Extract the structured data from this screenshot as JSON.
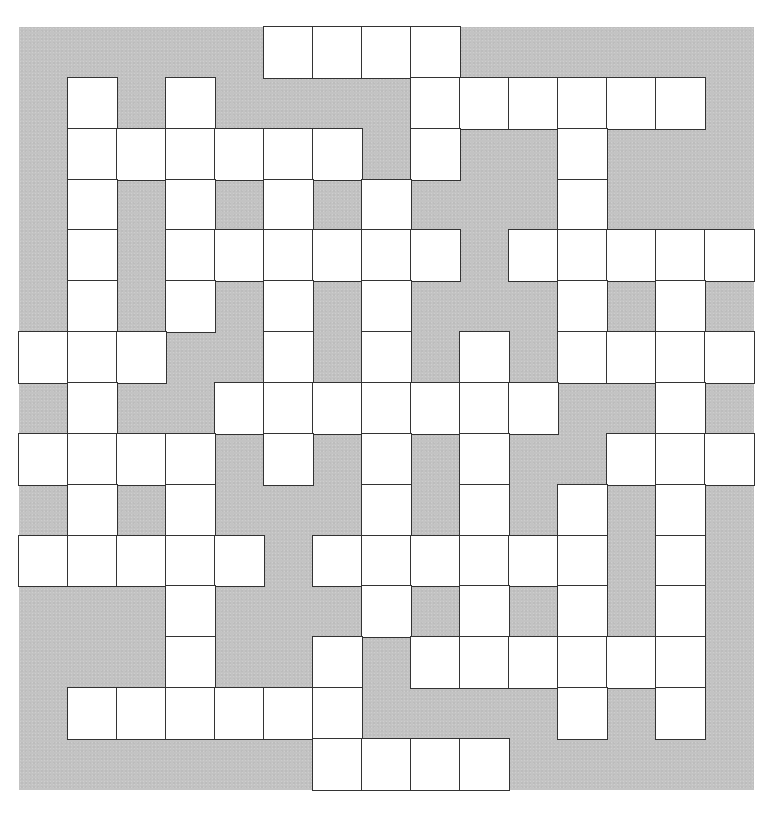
{
  "puzzle": {
    "type": "crossword",
    "rows": 15,
    "cols": 15,
    "colors": {
      "block": "#c3c3c3",
      "cell": "#ffffff",
      "border": "#333333",
      "page": "#ffffff"
    },
    "legend": {
      "1": "open-cell",
      "0": "block-cell"
    },
    "grid": [
      [
        0,
        0,
        0,
        0,
        0,
        1,
        1,
        1,
        1,
        0,
        0,
        0,
        0,
        0,
        0
      ],
      [
        0,
        1,
        0,
        1,
        0,
        0,
        0,
        0,
        1,
        1,
        1,
        1,
        1,
        1,
        0
      ],
      [
        0,
        1,
        1,
        1,
        1,
        1,
        1,
        0,
        1,
        0,
        0,
        1,
        0,
        0,
        0
      ],
      [
        0,
        1,
        0,
        1,
        0,
        1,
        0,
        1,
        0,
        0,
        0,
        1,
        0,
        0,
        0
      ],
      [
        0,
        1,
        0,
        1,
        1,
        1,
        1,
        1,
        1,
        0,
        1,
        1,
        1,
        1,
        1
      ],
      [
        0,
        1,
        0,
        1,
        0,
        1,
        0,
        1,
        0,
        0,
        0,
        1,
        0,
        1,
        0
      ],
      [
        1,
        1,
        1,
        0,
        0,
        1,
        0,
        1,
        0,
        1,
        0,
        1,
        1,
        1,
        1
      ],
      [
        0,
        1,
        0,
        0,
        1,
        1,
        1,
        1,
        1,
        1,
        1,
        0,
        0,
        1,
        0
      ],
      [
        1,
        1,
        1,
        1,
        0,
        1,
        0,
        1,
        0,
        1,
        0,
        0,
        1,
        1,
        1
      ],
      [
        0,
        1,
        0,
        1,
        0,
        0,
        0,
        1,
        0,
        1,
        0,
        1,
        0,
        1,
        0
      ],
      [
        1,
        1,
        1,
        1,
        1,
        0,
        1,
        1,
        1,
        1,
        1,
        1,
        0,
        1,
        0
      ],
      [
        0,
        0,
        0,
        1,
        0,
        0,
        0,
        1,
        0,
        1,
        0,
        1,
        0,
        1,
        0
      ],
      [
        0,
        0,
        0,
        1,
        0,
        0,
        1,
        0,
        1,
        1,
        1,
        1,
        1,
        1,
        0
      ],
      [
        0,
        1,
        1,
        1,
        1,
        1,
        1,
        0,
        0,
        0,
        0,
        1,
        0,
        1,
        0
      ],
      [
        0,
        0,
        0,
        0,
        0,
        0,
        1,
        1,
        1,
        1,
        0,
        0,
        0,
        0,
        0
      ]
    ],
    "letters": [],
    "numbers": []
  }
}
